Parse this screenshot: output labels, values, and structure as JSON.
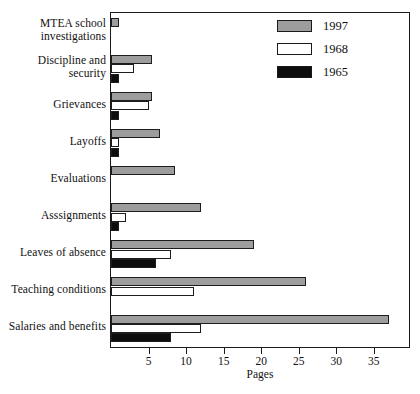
{
  "chart_data": {
    "type": "bar",
    "orientation": "horizontal",
    "title": "",
    "xlabel": "Pages",
    "ylabel": "",
    "xlim": [
      0,
      40
    ],
    "xticks": [
      5,
      10,
      15,
      20,
      25,
      30,
      35
    ],
    "xtick_labels": [
      "5",
      "10",
      "15",
      "20",
      "25",
      "30",
      "35"
    ],
    "grid": false,
    "legend_position": "top-right",
    "categories": [
      "MTEA school investigations",
      "Discipline and security",
      "Grievances",
      "Layoffs",
      "Evaluations",
      "Asssignments",
      "Leaves of absence",
      "Teaching conditions",
      "Salaries and benefits"
    ],
    "category_lines": [
      [
        "MTEA school",
        "investigations"
      ],
      [
        "Discipline and",
        "security"
      ],
      [
        "Grievances"
      ],
      [
        "Layoffs"
      ],
      [
        "Evaluations"
      ],
      [
        "Asssignments"
      ],
      [
        "Leaves of absence"
      ],
      [
        "Teaching conditions"
      ],
      [
        "Salaries and benefits"
      ]
    ],
    "series": [
      {
        "name": "1997",
        "color": "#9d9d9d",
        "values": [
          1,
          5.5,
          5.5,
          6.5,
          8.5,
          12,
          19,
          26,
          37
        ]
      },
      {
        "name": "1968",
        "color": "#ffffff",
        "values": [
          0,
          3,
          5,
          1,
          0,
          2,
          8,
          11,
          12
        ]
      },
      {
        "name": "1965",
        "color": "#0d0d0d",
        "values": [
          0,
          1,
          1,
          1,
          0,
          1,
          6,
          0,
          8
        ]
      }
    ]
  },
  "legend": {
    "items": [
      {
        "label": "1997",
        "swatch": "s1997"
      },
      {
        "label": "1968",
        "swatch": "s1968"
      },
      {
        "label": "1965",
        "swatch": "s1965"
      }
    ]
  }
}
